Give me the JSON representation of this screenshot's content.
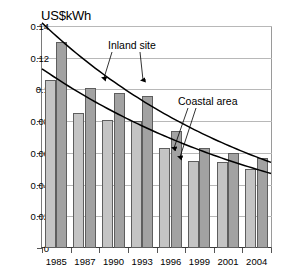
{
  "chart_data": {
    "type": "bar",
    "title": "",
    "subtitle": "",
    "xlabel": "",
    "ylabel": "US$kWh",
    "categories": [
      "1985",
      "1987",
      "1990",
      "1993",
      "1996",
      "1999",
      "2001",
      "2004"
    ],
    "series": [
      {
        "name": "Coastal area",
        "color": "#c4c4c4",
        "values": [
          0.106,
          0.085,
          0.081,
          0.08,
          0.063,
          0.055,
          0.054,
          0.05
        ]
      },
      {
        "name": "Inland site",
        "color": "#a2a2a2",
        "values": [
          0.13,
          0.101,
          0.098,
          0.096,
          0.074,
          0.063,
          0.06,
          0.057
        ]
      }
    ],
    "trendlines": [
      {
        "name": "Inland site",
        "label": "Inland site",
        "start": 0.142,
        "end": 0.054
      },
      {
        "name": "Coastal area",
        "label": "Coastal area",
        "start": 0.113,
        "end": 0.047
      }
    ],
    "annotations": [
      {
        "text": "Inland site",
        "points_to": [
          "1990",
          "1993"
        ]
      },
      {
        "text": "Coastal area",
        "points_to": [
          "1999",
          "1999"
        ]
      }
    ],
    "ylim": [
      0,
      0.14
    ],
    "yticks": [
      "0",
      "0.02",
      "0.04",
      "0.06",
      "0.08",
      "0.1",
      "0.12",
      "0.14"
    ],
    "ytick_values": [
      0,
      0.02,
      0.04,
      0.06,
      0.08,
      0.1,
      0.12,
      0.14
    ],
    "grid": true,
    "legend": "none"
  }
}
